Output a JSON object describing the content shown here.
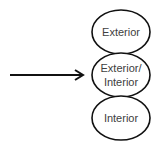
{
  "diagram": {
    "colors": {
      "stroke": "#111111",
      "text": "#404040",
      "background": "#ffffff"
    },
    "arrow": {
      "x1": 10,
      "y1": 75,
      "x2": 84,
      "y2": 75
    },
    "nodes": [
      {
        "id": "exterior",
        "lines": [
          "Exterior"
        ],
        "cx": 121,
        "cy": 32,
        "rx": 29,
        "ry": 22
      },
      {
        "id": "exterior-interior",
        "lines": [
          "Exterior/",
          "Interior"
        ],
        "cx": 121,
        "cy": 75,
        "rx": 29,
        "ry": 22
      },
      {
        "id": "interior",
        "lines": [
          "Interior"
        ],
        "cx": 121,
        "cy": 118,
        "rx": 29,
        "ry": 22
      }
    ]
  }
}
